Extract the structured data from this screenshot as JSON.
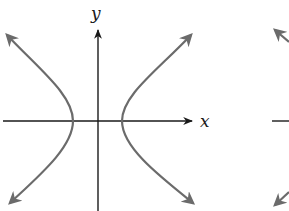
{
  "diagram": {
    "type": "hyperbola",
    "orientation": "horizontal (opens left and right)",
    "axes": {
      "x_label": "x",
      "y_label": "y",
      "origin": [
        98,
        121
      ]
    },
    "branches": [
      {
        "name": "left-branch",
        "vertex": [
          73,
          121
        ],
        "ends": [
          [
            5,
            33
          ],
          [
            8,
            205
          ]
        ]
      },
      {
        "name": "right-branch",
        "vertex": [
          122,
          121
        ],
        "ends": [
          [
            193,
            33
          ],
          [
            195,
            205
          ]
        ]
      }
    ],
    "colors": {
      "curve": "#6b6b6b",
      "axis": "#1a1a1a",
      "background": "#ffffff"
    },
    "partial_figure_right": {
      "visible": true,
      "description": "cropped second graph at right edge"
    }
  }
}
